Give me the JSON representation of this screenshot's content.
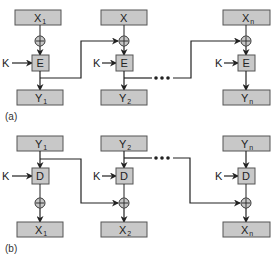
{
  "colors": {
    "box_fill": "#c8c8c8",
    "box_stroke": "#555555",
    "line": "#222222",
    "background": "#ffffff"
  },
  "part_a": {
    "label": "(a)",
    "key_label": "K",
    "op_label": "E",
    "xor_symbol": "⊕",
    "ellipsis": "•••",
    "columns": [
      {
        "input": "X",
        "input_sub": "1",
        "output": "Y",
        "output_sub": "1"
      },
      {
        "input": "X",
        "input_sub": "",
        "output": "Y",
        "output_sub": "2"
      },
      {
        "input": "X",
        "input_sub": "n",
        "output": "Y",
        "output_sub": "n"
      }
    ]
  },
  "part_b": {
    "label": "(b)",
    "key_label": "K",
    "op_label": "D",
    "xor_symbol": "⊕",
    "ellipsis": "•••",
    "columns": [
      {
        "input": "Y",
        "input_sub": "1",
        "output": "X",
        "output_sub": "1"
      },
      {
        "input": "Y",
        "input_sub": "2",
        "output": "X",
        "output_sub": "2"
      },
      {
        "input": "Y",
        "input_sub": "n",
        "output": "X",
        "output_sub": "n"
      }
    ]
  }
}
